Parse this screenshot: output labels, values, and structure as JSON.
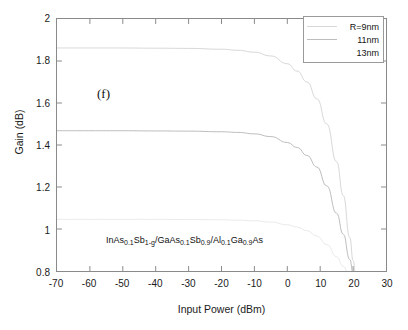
{
  "chart_data": {
    "type": "line",
    "title": "",
    "panel_tag": "(f)",
    "xlabel": "Input Power (dBm)",
    "ylabel": "Gain (dB)",
    "xlim": [
      -70,
      30
    ],
    "ylim": [
      0.8,
      2
    ],
    "xticks": [
      -70,
      -60,
      -50,
      -40,
      -30,
      -20,
      -10,
      0,
      10,
      20,
      30
    ],
    "xtick_labels": [
      "-70",
      "-60",
      "-50",
      "-40",
      "-30",
      "-20",
      "-10",
      "0",
      "10",
      "20",
      "30"
    ],
    "yticks": [
      0.8,
      1,
      1.2,
      1.4,
      1.6,
      1.8,
      2
    ],
    "ytick_labels": [
      "0.8",
      "1",
      "1.2",
      "1.4",
      "1.6",
      "1.8",
      "2"
    ],
    "grid": false,
    "legend_position": "top-right",
    "annotation": "InAs0.1Sb1-g/GaAs0.1Sb0.9/Al0.1Ga0.9As",
    "series": [
      {
        "name": "R=9nm",
        "color": "#d8d8d8",
        "x": [
          -70,
          -60,
          -50,
          -40,
          -30,
          -20,
          -15,
          -10,
          -5,
          0,
          3,
          6,
          9,
          12,
          15,
          17,
          19,
          20,
          21
        ],
        "y": [
          1.862,
          1.862,
          1.862,
          1.861,
          1.86,
          1.856,
          1.851,
          1.842,
          1.824,
          1.787,
          1.752,
          1.7,
          1.62,
          1.5,
          1.32,
          1.16,
          0.96,
          0.85,
          0.745
        ]
      },
      {
        "name": "11nm",
        "color": "#bdbdbd",
        "x": [
          -70,
          -60,
          -50,
          -40,
          -30,
          -20,
          -15,
          -10,
          -5,
          0,
          3,
          6,
          9,
          12,
          15,
          17,
          19,
          20,
          21
        ],
        "y": [
          1.468,
          1.468,
          1.468,
          1.467,
          1.466,
          1.463,
          1.46,
          1.453,
          1.44,
          1.412,
          1.388,
          1.35,
          1.295,
          1.205,
          1.075,
          0.975,
          0.855,
          0.79,
          0.748
        ]
      },
      {
        "name": "13nm",
        "color": "#eaeaea",
        "x": [
          -70,
          -60,
          -50,
          -40,
          -30,
          -20,
          -15,
          -10,
          -5,
          0,
          3,
          6,
          9,
          12,
          15,
          17,
          19,
          20,
          21
        ],
        "y": [
          1.046,
          1.046,
          1.046,
          1.046,
          1.045,
          1.044,
          1.042,
          1.039,
          1.033,
          1.02,
          1.009,
          0.992,
          0.966,
          0.926,
          0.868,
          0.822,
          0.77,
          0.742,
          0.715
        ]
      }
    ]
  },
  "legend": {
    "entries": [
      {
        "label": "R=9nm"
      },
      {
        "label": "11nm"
      },
      {
        "label": "13nm"
      }
    ]
  },
  "annotations": {
    "panel_tag": "(f)",
    "material": {
      "p1": "InAs",
      "s1": "0.1",
      "p2": "Sb",
      "s2": "1-g",
      "p3": "/GaAs",
      "s3": "0.1",
      "p4": "Sb",
      "s4": "0.9",
      "p5": "/Al",
      "s5": "0.1",
      "p6": "Ga",
      "s6": "0.9",
      "p7": "As"
    }
  },
  "axes": {
    "xlabel": "Input Power (dBm)",
    "ylabel": "Gain (dB)"
  },
  "colors": {
    "frame": "#8a8a8a",
    "text": "#1a1a1a",
    "background": "#ffffff"
  }
}
